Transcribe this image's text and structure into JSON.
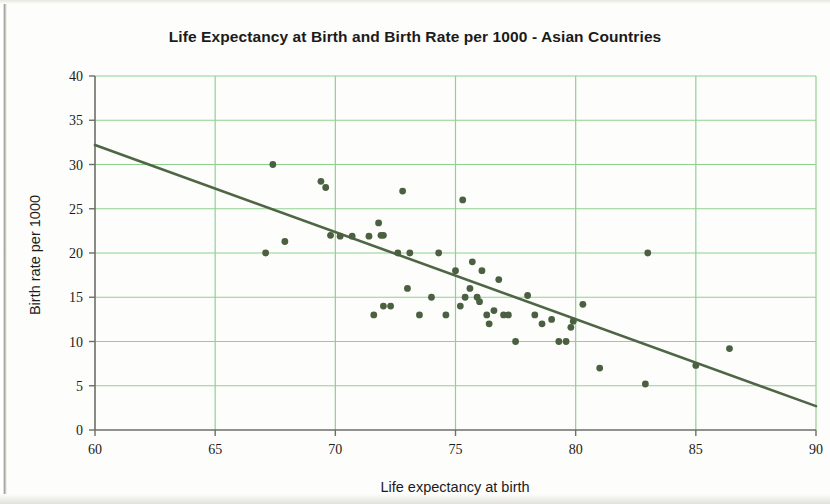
{
  "page": {
    "background_color": "#fdfdfb"
  },
  "chart_data": {
    "type": "scatter",
    "title": "Life Expectancy at Birth and Birth Rate per 1000 - Asian Countries",
    "xlabel": "Life expectancy at birth",
    "ylabel": "Birth rate per 1000",
    "xlim": [
      60,
      90
    ],
    "ylim": [
      0,
      40
    ],
    "xticks": [
      60,
      65,
      70,
      75,
      80,
      85,
      90
    ],
    "yticks": [
      0,
      5,
      10,
      15,
      20,
      25,
      30,
      35,
      40
    ],
    "grid": true,
    "grid_color": "#8fd18f",
    "point_color": "#4a6040",
    "trendline_color": "#4f6646",
    "legend": null,
    "x": [
      67.4,
      67.1,
      67.9,
      69.4,
      69.6,
      69.8,
      70.2,
      70.7,
      71.4,
      71.8,
      72.0,
      72.6,
      72.8,
      72.0,
      71.6,
      71.9,
      72.3,
      73.0,
      73.1,
      73.5,
      74.0,
      74.3,
      74.6,
      75.0,
      75.3,
      75.2,
      75.4,
      75.6,
      75.7,
      75.9,
      76.0,
      76.1,
      76.3,
      76.4,
      76.6,
      76.8,
      77.0,
      77.2,
      77.5,
      78.0,
      78.3,
      78.6,
      79.0,
      79.3,
      79.6,
      79.8,
      79.9,
      80.3,
      81.0,
      83.0,
      82.9,
      85.0,
      86.4
    ],
    "y": [
      30.0,
      20.0,
      21.3,
      28.1,
      27.4,
      22.0,
      21.9,
      21.9,
      21.9,
      23.4,
      22.0,
      20.0,
      27.0,
      14.0,
      13.0,
      22.0,
      14.0,
      16.0,
      20.0,
      13.0,
      15.0,
      20.0,
      13.0,
      18.0,
      26.0,
      14.0,
      15.0,
      16.0,
      19.0,
      15.0,
      14.5,
      18.0,
      13.0,
      12.0,
      13.5,
      17.0,
      13.0,
      13.0,
      10.0,
      15.2,
      13.0,
      12.0,
      12.5,
      10.0,
      10.0,
      11.6,
      12.3,
      14.2,
      7.0,
      20.0,
      5.2,
      7.3,
      9.2
    ],
    "trendline": {
      "x": [
        60,
        90
      ],
      "y": [
        32.2,
        2.7
      ]
    },
    "n_points": 53
  }
}
